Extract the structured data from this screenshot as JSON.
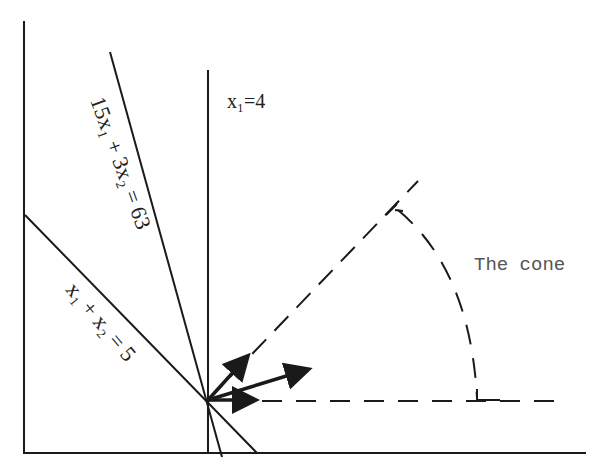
{
  "diagram": {
    "type": "linear-programming-cone",
    "colors": {
      "ink": "#1a1a1a",
      "label": "#222222",
      "cone_label": "#555555"
    },
    "labels": {
      "vertical_line": "x₁=4",
      "steep_line": "15x₁ + 3x₂ = 63",
      "shallow_line": "x₁ + x₂ = 5",
      "cone": "The cone"
    },
    "lines": [
      {
        "name": "x1 = 4",
        "style": "solid"
      },
      {
        "name": "15x1 + 3x2 = 63",
        "style": "solid"
      },
      {
        "name": "x1 + x2 = 5",
        "style": "solid"
      }
    ],
    "arrows": [
      {
        "name": "normal-of-steep-constraint"
      },
      {
        "name": "objective-gradient"
      },
      {
        "name": "normal-of-x1-constraint"
      }
    ],
    "cone": {
      "boundary_style": "dashed",
      "arc_style": "dashed"
    }
  }
}
